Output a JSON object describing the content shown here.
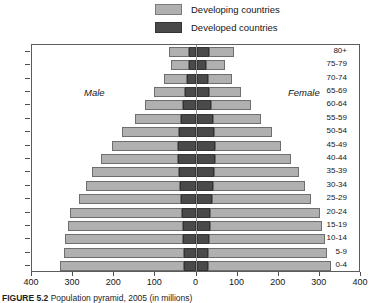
{
  "legend": {
    "items": [
      {
        "label": "Developing countries",
        "color": "#b0b0b0",
        "name": "developing"
      },
      {
        "label": "Developed countries",
        "color": "#4a4a4a",
        "name": "developed"
      }
    ]
  },
  "annotations": {
    "male": "Male",
    "female": "Female"
  },
  "caption": {
    "figure_number": "FIGURE 5.2",
    "text": "Population pyramid, 2005 (in millions)"
  },
  "chart_data": {
    "type": "bar",
    "subtype": "population-pyramid",
    "title": "Population pyramid, 2005 (in millions)",
    "xlabel": "",
    "ylabel": "",
    "xlim": [
      -400,
      400
    ],
    "xticks": [
      -400,
      -300,
      -200,
      -100,
      0,
      100,
      200,
      300,
      400
    ],
    "xtick_labels": [
      "400",
      "300",
      "200",
      "100",
      "0",
      "100",
      "200",
      "300",
      "400"
    ],
    "grid": false,
    "legend_position": "top-center",
    "units": "millions",
    "left_side": "Male",
    "right_side": "Female",
    "categories": [
      "0-4",
      "5-9",
      "10-14",
      "15-19",
      "20-24",
      "25-29",
      "30-34",
      "35-39",
      "40-44",
      "45-49",
      "50-54",
      "55-59",
      "60-64",
      "65-69",
      "70-74",
      "75-79",
      "80+"
    ],
    "series": [
      {
        "name": "Developing countries",
        "color": "#b0b0b0",
        "male": [
          302,
          292,
          288,
          280,
          272,
          248,
          228,
          212,
          188,
          162,
          138,
          112,
          92,
          74,
          56,
          42,
          48
        ],
        "female": [
          298,
          288,
          282,
          274,
          266,
          242,
          224,
          208,
          186,
          162,
          140,
          116,
          96,
          78,
          60,
          46,
          60
        ]
      },
      {
        "name": "Developed countries",
        "color": "#4a4a4a",
        "male": [
          30,
          31,
          32,
          33,
          36,
          38,
          40,
          43,
          45,
          44,
          42,
          38,
          34,
          29,
          24,
          19,
          18
        ],
        "female": [
          28,
          29,
          30,
          32,
          34,
          37,
          39,
          42,
          44,
          44,
          43,
          40,
          36,
          31,
          27,
          23,
          30
        ]
      }
    ]
  }
}
